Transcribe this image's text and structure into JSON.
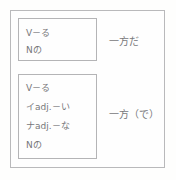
{
  "figure": {
    "colors": {
      "background": "#fefefd",
      "frame_border": "#b9b9bb",
      "box_border": "#b4b4b6",
      "text": "#77777a"
    }
  },
  "rows": [
    {
      "forms": [
        "V－る",
        "Nの"
      ],
      "pattern": "一方だ"
    },
    {
      "forms": [
        "V－る",
        "イadj.－い",
        "ナadj.－な",
        "Nの"
      ],
      "pattern": "一方（で）"
    }
  ]
}
